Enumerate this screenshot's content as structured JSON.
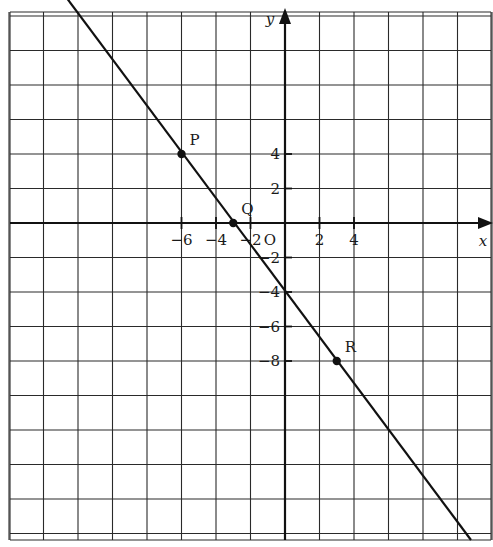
{
  "chart_data": {
    "type": "line",
    "title": "",
    "xlabel": "x",
    "ylabel": "y",
    "origin_label": "O",
    "xlim": [
      -8,
      6
    ],
    "ylim": [
      -9,
      6
    ],
    "grid": true,
    "x_ticks": [
      -6,
      -4,
      -2,
      2,
      4
    ],
    "y_ticks": [
      4,
      2,
      -2,
      -4,
      -6,
      -8
    ],
    "x_tick_labels": [
      "−6",
      "−4",
      "−2",
      "2",
      "4"
    ],
    "y_tick_labels": [
      "4",
      "2",
      "−2",
      "−4",
      "−6",
      "−8"
    ],
    "line": {
      "equation": "y = -4/3 x - 4",
      "slope": -1.3333,
      "intercept": -4
    },
    "points": [
      {
        "label": "P",
        "x": -6,
        "y": 4
      },
      {
        "label": "Q",
        "x": -3,
        "y": 0
      },
      {
        "label": "R",
        "x": 3,
        "y": -8
      }
    ]
  }
}
